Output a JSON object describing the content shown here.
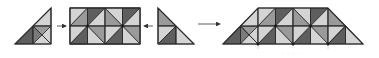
{
  "diagram": {
    "colors": {
      "light": "#d4d4d4",
      "mid": "#9a9a9a",
      "dark": "#5e5e5e",
      "line": "#2a2a2a",
      "arrow": "#333333"
    },
    "pieces": [
      {
        "id": "left-triangle",
        "label": "left triangle piece"
      },
      {
        "id": "rectangle",
        "label": "rectangle piece"
      },
      {
        "id": "right-triangle",
        "label": "right triangle piece"
      },
      {
        "id": "trapezoid",
        "label": "combined trapezoid"
      }
    ],
    "arrows": [
      {
        "id": "arrow-into-rectangle-from-left",
        "direction": "right"
      },
      {
        "id": "arrow-into-rectangle-from-right",
        "direction": "left"
      },
      {
        "id": "arrow-result",
        "direction": "right"
      }
    ],
    "caption": "· · · ·"
  }
}
